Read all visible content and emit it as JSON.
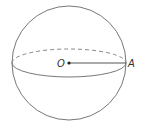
{
  "diagram": {
    "type": "sphere",
    "labels": {
      "center": "O",
      "point": "A"
    },
    "stroke_color": "#666666",
    "elements": [
      "outline-circle",
      "equator-front-solid",
      "equator-back-dashed",
      "radius-segment-OA"
    ]
  }
}
